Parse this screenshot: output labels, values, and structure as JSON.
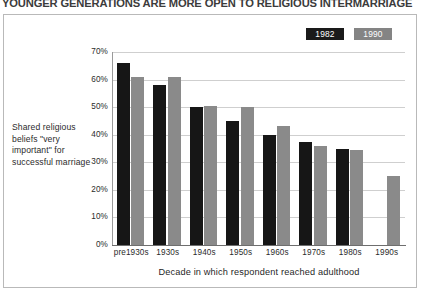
{
  "headline": "YOUNGER GENERATIONS ARE MORE OPEN TO RELIGIOUS INTERMARRIAGE",
  "side_caption": "Shared religious beliefs \"very important\" for successful marriage",
  "legend": {
    "items": [
      {
        "label": "1982",
        "color": "#1a1a1a"
      },
      {
        "label": "1990",
        "color": "#848484"
      }
    ]
  },
  "chart_data": {
    "type": "bar",
    "title": "YOUNGER GENERATIONS ARE MORE OPEN TO RELIGIOUS INTERMARRIAGE",
    "xlabel": "Decade in which respondent reached adulthood",
    "ylabel": "",
    "ylim": [
      0,
      70
    ],
    "ytick_labels": [
      "70%",
      "60%",
      "50%",
      "40%",
      "30%",
      "20%",
      "10%",
      "0%"
    ],
    "ytick_values": [
      70,
      60,
      50,
      40,
      30,
      20,
      10,
      0
    ],
    "grid": true,
    "legend_position": "top-right",
    "categories": [
      "pre1930s",
      "1930s",
      "1940s",
      "1950s",
      "1960s",
      "1970s",
      "1980s",
      "1990s"
    ],
    "series": [
      {
        "name": "1982",
        "color": "#161616",
        "values": [
          66,
          58,
          50,
          45,
          40,
          37.5,
          35,
          null
        ]
      },
      {
        "name": "1990",
        "color": "#8a8a8a",
        "values": [
          61,
          61,
          50.5,
          50,
          43,
          36,
          34.5,
          25
        ]
      }
    ]
  }
}
